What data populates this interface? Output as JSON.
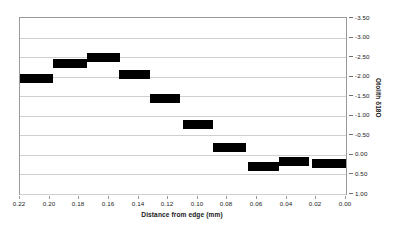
{
  "chart_data": {
    "type": "bar",
    "title": "",
    "subtitle": "",
    "xlabel": "Distance from edge (mm)",
    "ylabel": "Otolith δ18O",
    "xlim": [
      0.22,
      0.0
    ],
    "ylim": [
      -3.5,
      1.0
    ],
    "y_inverted": true,
    "x_inverted": true,
    "grid": true,
    "legend": "none",
    "y_ticks": [
      "-3.50",
      "-3.00",
      "-2.50",
      "-2.00",
      "-1.50",
      "-1.00",
      "-0.50",
      "0.00",
      "0.50",
      "1.00"
    ],
    "y_tick_values": [
      -3.5,
      -3.0,
      -2.5,
      -2.0,
      -1.5,
      -1.0,
      -0.5,
      0.0,
      0.5,
      1.0
    ],
    "x_ticks": [
      "0.22",
      "0.20",
      "0.18",
      "0.16",
      "0.14",
      "0.12",
      "0.10",
      "0.08",
      "0.06",
      "0.04",
      "0.02",
      "0.00"
    ],
    "x_tick_values": [
      0.22,
      0.2,
      0.18,
      0.16,
      0.14,
      0.12,
      0.1,
      0.08,
      0.06,
      0.04,
      0.02,
      0.0
    ],
    "series": [
      {
        "name": "Otolith δ18O profile",
        "color": "#000000",
        "style": "horizontal-interval-bars",
        "points": [
          {
            "x_start": 0.22,
            "x_end": 0.198,
            "value": -1.95
          },
          {
            "x_start": 0.198,
            "x_end": 0.175,
            "value": -2.33
          },
          {
            "x_start": 0.175,
            "x_end": 0.153,
            "value": -2.5
          },
          {
            "x_start": 0.153,
            "x_end": 0.132,
            "value": -2.05
          },
          {
            "x_start": 0.132,
            "x_end": 0.112,
            "value": -1.43
          },
          {
            "x_start": 0.11,
            "x_end": 0.09,
            "value": -0.77
          },
          {
            "x_start": 0.09,
            "x_end": 0.068,
            "value": -0.2
          },
          {
            "x_start": 0.066,
            "x_end": 0.045,
            "value": 0.3
          },
          {
            "x_start": 0.045,
            "x_end": 0.025,
            "value": 0.17
          },
          {
            "x_start": 0.023,
            "x_end": 0.0,
            "value": 0.22
          }
        ]
      }
    ]
  }
}
